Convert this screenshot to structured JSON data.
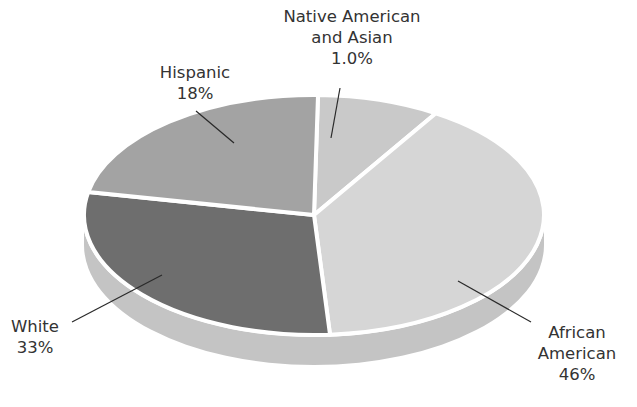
{
  "chart_data": {
    "type": "pie",
    "style": "3d-tilted",
    "title": "",
    "categories": [
      "Native American and Asian",
      "African American",
      "White",
      "Hispanic"
    ],
    "values": [
      1.0,
      46,
      33,
      18
    ],
    "value_labels": [
      "1.0%",
      "46%",
      "33%",
      "18%"
    ],
    "colors": [
      "#c9c9c9",
      "#d6d6d6",
      "#6e6e6e",
      "#a3a3a3"
    ],
    "side_color": "#c4c4c4",
    "separator_color": "#ffffff",
    "legend": "none (leader-line labels)",
    "slices": [
      {
        "name": "Native American and Asian",
        "value": 1.0,
        "label_lines": [
          "Native American",
          "and Asian",
          "1.0%"
        ],
        "start_deg": -89,
        "end_deg": -58,
        "color": "#c9c9c9"
      },
      {
        "name": "African American",
        "value": 46,
        "label_lines": [
          "African",
          "American",
          "46%"
        ],
        "start_deg": -58,
        "end_deg": 86,
        "color": "#d6d6d6"
      },
      {
        "name": "White",
        "value": 33,
        "label_lines": [
          "White",
          "33%"
        ],
        "start_deg": 86,
        "end_deg": 191,
        "color": "#6e6e6e"
      },
      {
        "name": "Hispanic",
        "value": 18,
        "label_lines": [
          "Hispanic",
          "18%"
        ],
        "start_deg": 191,
        "end_deg": 271,
        "color": "#a3a3a3"
      }
    ]
  },
  "labels": {
    "native": {
      "line1": "Native American",
      "line2": "and Asian",
      "line3": "1.0%"
    },
    "hispanic": {
      "line1": "Hispanic",
      "line2": "18%"
    },
    "white": {
      "line1": "White",
      "line2": "33%"
    },
    "african": {
      "line1": "African",
      "line2": "American",
      "line3": "46%"
    }
  }
}
